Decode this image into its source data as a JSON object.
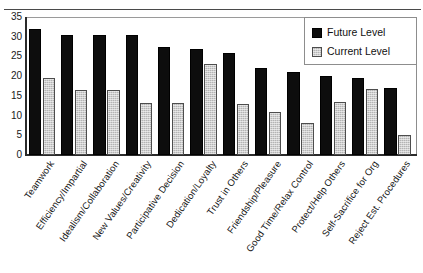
{
  "chart_data": {
    "type": "bar",
    "title": "",
    "xlabel": "",
    "ylabel": "",
    "ylim": [
      0,
      35
    ],
    "yticks": [
      0,
      5,
      10,
      15,
      20,
      25,
      30,
      35
    ],
    "grid": false,
    "legend_position": "top-right",
    "categories": [
      "Teamwork",
      "Efficiency/Impartial",
      "Idealism/Collaboration",
      "New Values/Creativity",
      "Participative Decision",
      "Dedication/Loyalty",
      "Trust in Others",
      "Friendship/Pleasure",
      "Good Time/Relax Control",
      "Protect/Help Others",
      "Self-Sacrifice for Org",
      "Reject Est. Procedures"
    ],
    "series": [
      {
        "name": "Future Level",
        "color": "#0d0d0d",
        "values": [
          32,
          30.5,
          30.5,
          30.5,
          27.3,
          27,
          26,
          22,
          21,
          20,
          19.5,
          17
        ]
      },
      {
        "name": "Current Level",
        "color": "#b4b4b4",
        "values": [
          19.5,
          16.5,
          16.5,
          13.3,
          13.2,
          23,
          13,
          11,
          8,
          13.5,
          16.8,
          5
        ]
      }
    ]
  },
  "legend": {
    "items": [
      {
        "label": "Future Level"
      },
      {
        "label": "Current Level"
      }
    ]
  }
}
